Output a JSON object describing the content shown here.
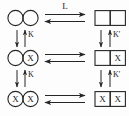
{
  "diagram": {
    "type": "allosteric-equilibrium-scheme",
    "colors": {
      "stroke": "#262626",
      "text": "#1a1a1a",
      "background": "#fdfdfd"
    },
    "occupancy_symbol": "X",
    "rows": [
      {
        "id": "row-0",
        "left": {
          "shape": "circle-pair",
          "subunits": [
            {
              "id": "r0-l-sub0",
              "filled": false,
              "label": ""
            },
            {
              "id": "r0-l-sub1",
              "filled": false,
              "label": ""
            }
          ]
        },
        "right": {
          "shape": "square-pair",
          "subunits": [
            {
              "id": "r0-r-sub0",
              "filled": false,
              "label": ""
            },
            {
              "id": "r0-r-sub1",
              "filled": false,
              "label": ""
            }
          ]
        },
        "horizontal_arrow": {
          "id": "arrow-h-0",
          "label": "L",
          "style": "double-reversible"
        }
      },
      {
        "id": "row-1",
        "left": {
          "shape": "circle-pair",
          "subunits": [
            {
              "id": "r1-l-sub0",
              "filled": false,
              "label": ""
            },
            {
              "id": "r1-l-sub1",
              "filled": true,
              "label": "X"
            }
          ]
        },
        "right": {
          "shape": "square-pair",
          "subunits": [
            {
              "id": "r1-r-sub0",
              "filled": false,
              "label": ""
            },
            {
              "id": "r1-r-sub1",
              "filled": true,
              "label": "X"
            }
          ]
        },
        "horizontal_arrow": {
          "id": "arrow-h-1",
          "label": "",
          "style": "double-reversible"
        }
      },
      {
        "id": "row-2",
        "left": {
          "shape": "circle-pair",
          "subunits": [
            {
              "id": "r2-l-sub0",
              "filled": true,
              "label": "X"
            },
            {
              "id": "r2-l-sub1",
              "filled": true,
              "label": "X"
            }
          ]
        },
        "right": {
          "shape": "square-pair",
          "subunits": [
            {
              "id": "r2-r-sub0",
              "filled": true,
              "label": "X"
            },
            {
              "id": "r2-r-sub1",
              "filled": true,
              "label": "X"
            }
          ]
        },
        "horizontal_arrow": {
          "id": "arrow-h-2",
          "label": "",
          "style": "double-reversible"
        }
      }
    ],
    "vertical_arrows": [
      {
        "id": "arrow-v-left-0",
        "label": "K",
        "column": "left",
        "between": "row-0/row-1"
      },
      {
        "id": "arrow-v-left-1",
        "label": "K",
        "column": "left",
        "between": "row-1/row-2"
      },
      {
        "id": "arrow-v-right-0",
        "label": "K'",
        "column": "right",
        "between": "row-0/row-1"
      },
      {
        "id": "arrow-v-right-1",
        "label": "K'",
        "column": "right",
        "between": "row-1/row-2"
      }
    ]
  }
}
